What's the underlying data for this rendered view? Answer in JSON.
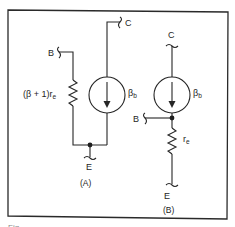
{
  "figure": {
    "type": "circuit-diagram",
    "colors": {
      "ink": "#262626",
      "background": "#ffffff"
    }
  },
  "panel_a": {
    "caption": "(A)",
    "terminals": {
      "base": "B",
      "collector": "C",
      "emitter": "E"
    },
    "resistor_label_prefix": "(β + 1)r",
    "resistor_label_sub": "e",
    "source_label_main": "β",
    "source_label_sub": "b"
  },
  "panel_b": {
    "caption": "(B)",
    "terminals": {
      "base": "B",
      "collector": "C",
      "emitter": "E"
    },
    "resistor_label_main": "r",
    "resistor_label_sub": "e",
    "source_label_main": "β",
    "source_label_sub": "b"
  },
  "footer": {
    "caption_fragment": "Fig."
  }
}
